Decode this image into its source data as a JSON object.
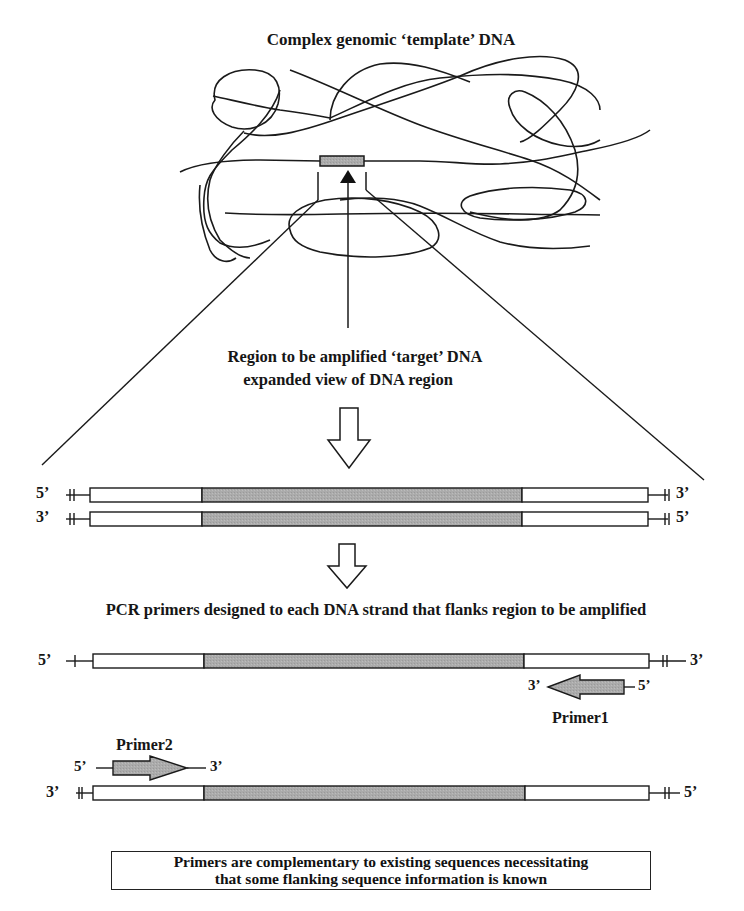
{
  "title": "Complex genomic ‘template’ DNA",
  "target_label": {
    "line1": "Region to be amplified ‘target’ DNA",
    "line2": "expanded view of DNA region"
  },
  "strands_double": {
    "top": {
      "left_end": "5’",
      "right_end": "3’"
    },
    "bottom": {
      "left_end": "3’",
      "right_end": "5’"
    }
  },
  "pcr_heading": "PCR primers designed to each DNA strand that flanks region to be amplified",
  "strand_a": {
    "left_end": "5’",
    "right_end": "3’"
  },
  "primer1": {
    "label": "Primer1",
    "left_end": "3’",
    "right_end": "5’",
    "direction": "left"
  },
  "primer2": {
    "label": "Primer2",
    "left_end": "5’",
    "right_end": "3’",
    "direction": "right"
  },
  "strand_b": {
    "left_end": "3’",
    "right_end": "5’"
  },
  "note": {
    "line1": "Primers are complementary to existing sequences necessitating",
    "line2": "that some flanking sequence information is known"
  },
  "colors": {
    "target_fill": "#a9a9a9",
    "line": "#1a1a1a",
    "flank_fill": "#ffffff"
  }
}
